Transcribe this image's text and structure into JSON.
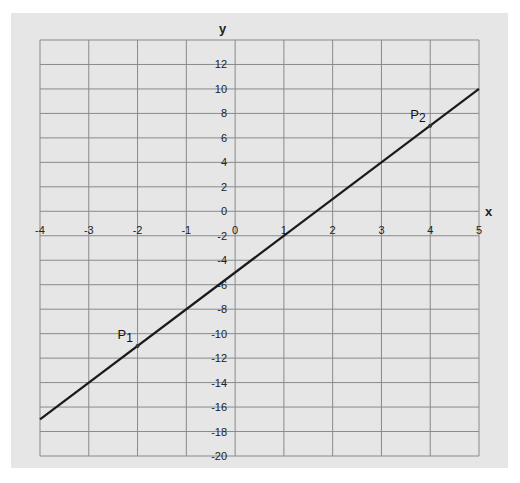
{
  "chart_data": {
    "type": "line",
    "title": "",
    "xlabel": "x",
    "ylabel": "y",
    "xlim": [
      -4,
      5
    ],
    "ylim": [
      -20,
      14
    ],
    "grid": true,
    "legend": null,
    "x_ticks": [
      -4,
      -3,
      -2,
      -1,
      0,
      1,
      2,
      3,
      4,
      5
    ],
    "y_ticks": [
      12,
      10,
      8,
      6,
      4,
      2,
      0,
      -2,
      -4,
      -6,
      -8,
      -10,
      -12,
      -14,
      -16,
      -18,
      -20
    ],
    "series": [
      {
        "name": "line",
        "equation": "y = 3x - 5",
        "x": [
          -4,
          5
        ],
        "y": [
          -17,
          10
        ],
        "color": "#1a1a1a"
      }
    ],
    "points": [
      {
        "label": "P",
        "subscript": "1",
        "x": -2,
        "y": -11
      },
      {
        "label": "P",
        "subscript": "2",
        "x": 4,
        "y": 7
      }
    ],
    "colors": {
      "background": "#e6e6e6",
      "grid": "#8a8a8a",
      "line": "#1a1a1a"
    }
  }
}
